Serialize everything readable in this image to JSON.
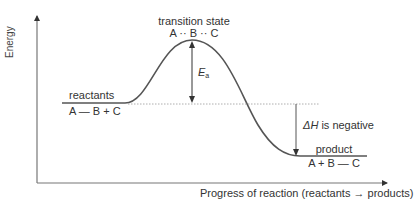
{
  "diagram": {
    "type": "energy profile diagram (exothermic reaction)",
    "axes": {
      "y_label": "Energy",
      "x_label": "Progress of reaction (reactants → products)"
    },
    "labels": {
      "transition_state": "transition state",
      "transition_state_species": "A ·· B ·· C",
      "reactants": "reactants",
      "reactants_species": "A — B + C",
      "product": "product",
      "product_species": "A + B — C",
      "activation_energy_symbol": "E",
      "activation_energy_subscript": "a",
      "enthalpy_change_symbol": "ΔH",
      "enthalpy_change_text": " is negative"
    },
    "colors": {
      "curve": "#555555",
      "axes": "#777777",
      "dashed_line": "#999999",
      "text": "#333333"
    }
  }
}
